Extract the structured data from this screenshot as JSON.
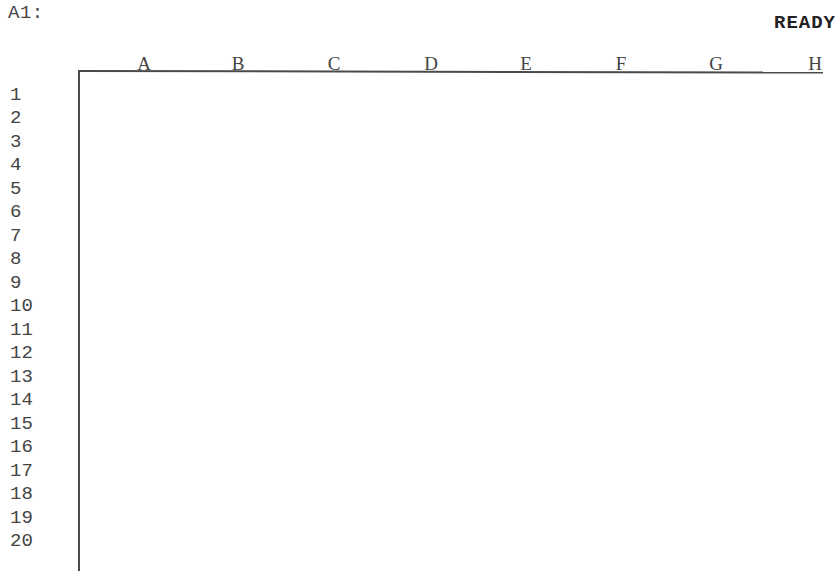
{
  "status_bar": {
    "cell_reference": "A1:",
    "mode_indicator": "READY"
  },
  "columns": [
    "A",
    "B",
    "C",
    "D",
    "E",
    "F",
    "G",
    "H"
  ],
  "rows": [
    "1",
    "2",
    "3",
    "4",
    "5",
    "6",
    "7",
    "8",
    "9",
    "10",
    "11",
    "12",
    "13",
    "14",
    "15",
    "16",
    "17",
    "18",
    "19",
    "20"
  ],
  "colors": {
    "background": "#ffffff",
    "text": "#444444",
    "grid_line": "#4a4a4a"
  }
}
